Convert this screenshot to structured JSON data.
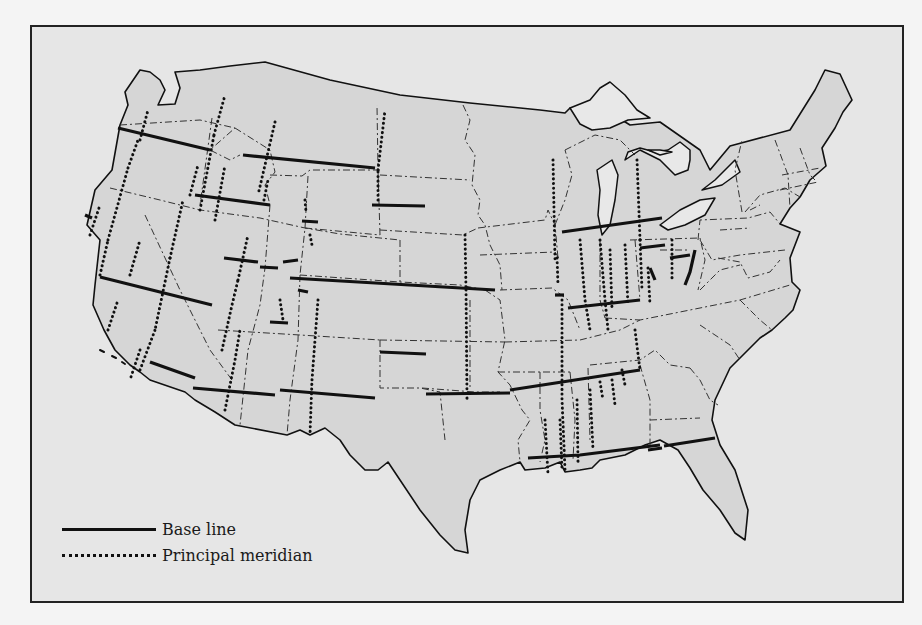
{
  "map": {
    "colors": {
      "background": "#e6e6e6",
      "land": "#d6d6d6",
      "water": "#e8e8e8",
      "line": "#111111",
      "border": "#222222"
    },
    "outline": "M265,62 L330,80 L400,95 L470,103 L540,110 L565,113 L570,108 L580,114 L582,120 L600,124 L622,120 L630,125 L660,122 L700,150 L710,170 L730,146 L790,130 L815,90 L825,70 L840,74 L852,100 L843,112 L835,128 L822,148 L826,166 L810,180 L800,197 L790,208 L780,224 L800,232 L790,258 L792,282 L800,290 L793,310 L785,318 L772,330 L760,338 L730,368 L715,400 L712,420 L720,445 L735,470 L748,510 L745,540 L735,533 L720,510 L703,490 L690,468 L678,450 L660,440 L645,445 L625,455 L600,460 L592,468 L580,470 L565,472 L560,462 L545,468 L525,470 L520,462 L500,470 L480,480 L470,500 L465,530 L468,553 L455,550 L440,535 L420,510 L400,480 L388,462 L378,470 L365,470 L350,455 L340,440 L325,428 L310,435 L300,430 L287,435 L235,425 L215,412 L195,400 L185,392 L150,380 L140,372 L130,365 L115,350 L104,330 L93,305 L95,285 L100,240 L87,225 L95,190 L112,170 L120,125 L128,105 L125,92 L140,70 L150,72 L160,80 L165,90 L158,105 L175,104 L180,88 L175,72 L200,70 L230,66 Z",
    "lakes": [
      "M570,108 L590,100 L600,88 L610,82 L625,95 L637,110 L650,118 L628,120 L610,128 L592,130 L580,124 Z",
      "M597,170 L612,160 L618,175 L615,200 L610,225 L602,235 L598,215 L600,190 Z",
      "M625,160 L640,150 L660,160 L675,175 L688,170 L690,160 L690,150 L680,142 L668,150 L655,152 L640,148 L628,152 Z",
      "M660,225 L680,210 L700,200 L715,198 L705,215 L685,225 L668,230 Z",
      "M702,190 L715,180 L735,160 L740,172 L722,185 Z",
      "M648,150 L660,150 L672,152 L660,155 Z"
    ],
    "state_borders": [
      "M120,125 L200,120 L235,128 L210,150 L230,160 L240,155",
      "M110,188 L160,200 L200,210 L260,218 L305,228 L340,234 L400,240",
      "M212,118 L200,205",
      "M235,128 L270,150 L275,172 L265,185 L270,205",
      "M270,205 L265,268 L260,305 L248,350 L240,425",
      "M145,215 L180,290 L210,350 L232,380",
      "M308,176 L305,228 L300,275",
      "M305,228 L380,235",
      "M380,235 L378,170 L377,105",
      "M270,175 L302,176 L310,170 L380,170",
      "M300,275 L400,282 L460,285 L485,290",
      "M400,240 L400,282",
      "M463,105 L470,120 L465,140 L475,155 L472,185 L480,200 L478,215 L485,225 L490,245 L500,265 L502,290",
      "M380,175 L470,180",
      "M380,230 L463,235 L478,228",
      "M485,290 L500,300 L505,340 L498,372 L510,385 L522,410 L530,420 L518,440 L520,462",
      "M300,275 L298,340 L290,400 L287,435",
      "M218,330 L300,335 L380,340",
      "M380,340 L380,388 L420,388 L440,392 L445,440",
      "M380,340 L505,342",
      "M470,300 L470,388",
      "M422,388 L475,392 L500,392",
      "M478,228 L545,220 L548,210 L555,225 L558,258",
      "M480,255 L555,252 L560,260",
      "M500,290 L552,288 L568,300 L580,330",
      "M505,342 L580,340 L620,330 L640,320 L690,310 L740,300 L790,285",
      "M498,372 L540,372 L570,372",
      "M540,372 L540,410 L545,440 L540,462",
      "M570,372 L575,420 L573,460",
      "M588,368 L590,440",
      "M590,365 L640,360 L655,350 L670,365 L690,368",
      "M640,365 L650,400 L650,445",
      "M650,420 L700,418",
      "M690,368 L700,380 L710,400 L718,405",
      "M555,225 L565,200 L572,175 L565,150",
      "M565,150 L595,135 L620,140 L635,155",
      "M600,240 L600,300 L605,318",
      "M635,240 L640,300",
      "M630,240 L700,238 L705,260 L698,290",
      "M660,250 L690,250",
      "M698,240 L700,220 L748,218 L770,212 L780,224",
      "M700,240 L712,260 L740,255 L785,250",
      "M720,230 L750,228",
      "M742,212 L735,170 L742,140",
      "M745,212 L760,195 L785,188 L800,197",
      "M750,210 L760,205",
      "M775,140 L788,175 L790,208",
      "M800,148 L810,175 L815,180",
      "M782,175 L820,168",
      "M780,190 L818,182",
      "M718,258 L740,262 L748,278 L770,272 L780,260",
      "M700,290 L720,270 L740,265",
      "M605,318 L640,320",
      "M740,300 L760,320 L772,330",
      "M700,325 L730,345 L740,360"
    ],
    "base_lines": [
      "M118,128 L210,150",
      "M243,155 L375,168",
      "M195,195 L270,205",
      "M302,221 L318,222",
      "M372,205 L425,206",
      "M85,215 L92,218",
      "M224,258 L258,262",
      "M260,267 L278,268",
      "M283,262 L298,260",
      "M290,278 L495,290",
      "M298,290 L308,292",
      "M100,277 L212,305",
      "M270,322 L288,323",
      "M380,352 L426,354",
      "M150,362 L195,378",
      "M193,388 L275,395",
      "M280,390 L375,398",
      "M426,394 L510,393",
      "M510,390 L575,380 L640,370",
      "M528,458 L580,455 L660,445",
      "M648,450 L662,448",
      "M664,446 L715,438",
      "M562,232 L662,218",
      "M555,295 L564,295",
      "M568,308 L640,300",
      "M640,248 L665,245",
      "M670,258 L690,255",
      "M650,268 L655,280",
      "M695,250 L690,272 L685,285"
    ],
    "meridians": [
      "M140,140 L148,110",
      "M128,168 L138,140",
      "M108,240 L128,168",
      "M100,275 L108,240",
      "M90,235 L100,205",
      "M108,330 L118,300",
      "M130,275 L140,240",
      "M200,210 L214,135",
      "M214,135 L225,95",
      "M190,195 L198,165",
      "M140,350 L130,380",
      "M170,258 L183,200",
      "M215,220 L225,165",
      "M170,258 L155,330",
      "M140,370 L155,330",
      "M222,350 L232,305 L238,280",
      "M238,280 L248,235",
      "M305,200 L306,212",
      "M275,122 L258,195",
      "M310,235 L312,245",
      "M378,170 L385,110",
      "M378,200 L378,170",
      "M264,200 L268,180",
      "M225,410 L235,360 L240,330",
      "M280,300 L283,320",
      "M318,300 L312,380 L310,435",
      "M465,235 L466,290",
      "M466,290 L467,400",
      "M553,160 L555,260",
      "M557,258 L558,285",
      "M562,300 L562,400 L565,470",
      "M580,240 L585,300 L590,330",
      "M600,240 L605,300 L608,330",
      "M610,250 L612,310",
      "M625,245 L628,305",
      "M637,160 L640,240",
      "M640,240 L642,290",
      "M635,330 L640,370",
      "M648,268 L650,305",
      "M672,240 L672,280",
      "M545,420 L548,475",
      "M560,420 L562,470",
      "M577,400 L578,462",
      "M590,390 L593,450",
      "M600,382 L603,400",
      "M612,380 L615,405",
      "M622,370 L625,385"
    ],
    "islands": [
      "M100,350 L104,352",
      "M112,356 L116,358",
      "M122,362 L125,364"
    ]
  },
  "legend": {
    "items": [
      {
        "label": "Base line",
        "style": "solid"
      },
      {
        "label": "Principal meridian",
        "style": "dotted"
      }
    ]
  }
}
